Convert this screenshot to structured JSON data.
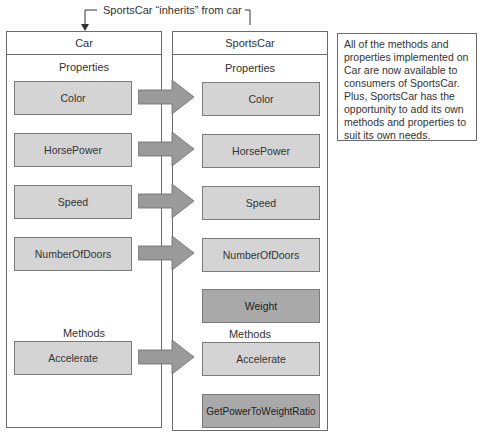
{
  "inheritance_label": "SportsCar “inherits” from car",
  "note": "All of the methods and properties implemented on Car are now available to consumers of SportsCar. Plus, SportsCar has the opportunity to add its own methods and properties to suit its own needs.",
  "base_class": {
    "title": "Car",
    "properties_label": "Properties",
    "properties": [
      "Color",
      "HorsePower",
      "Speed",
      "NumberOfDoors"
    ],
    "methods_label": "Methods",
    "methods": [
      "Accelerate"
    ]
  },
  "derived_class": {
    "title": "SportsCar",
    "properties_label": "Properties",
    "properties": [
      "Color",
      "HorsePower",
      "Speed",
      "NumberOfDoors",
      "Weight"
    ],
    "methods_label": "Methods",
    "methods": [
      "Accelerate",
      "GetPowerToWeightRatio"
    ],
    "new_members": [
      "Weight",
      "GetPowerToWeightRatio"
    ]
  },
  "colors": {
    "inherited_member_fill": "#d4d4d4",
    "new_member_fill": "#a9a9a9",
    "arrow_fill": "#9a9a9a",
    "border": "#6b6b6b"
  }
}
